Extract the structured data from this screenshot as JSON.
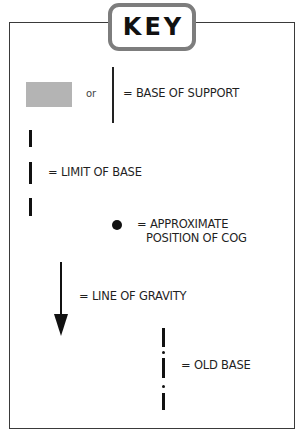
{
  "title": "KEY",
  "colors": {
    "key_border": "#7d7d7d",
    "base_of_support_fill": "#b4b4b4",
    "line": "#111111",
    "frame": "#3a3a3a"
  },
  "entries": [
    {
      "id": "base-of-support",
      "symbols": [
        "gray-rectangle",
        "vertical-line"
      ],
      "separator": "or",
      "label": "= BASE OF SUPPORT"
    },
    {
      "id": "limit-of-base",
      "symbols": [
        "thick-dashed-vertical-line"
      ],
      "label": "= LIMIT OF BASE"
    },
    {
      "id": "cog",
      "symbols": [
        "filled-dot"
      ],
      "label_line1": "= APPROXIMATE",
      "label_line2": "POSITION OF COG"
    },
    {
      "id": "line-of-gravity",
      "symbols": [
        "down-arrow"
      ],
      "label": "= LINE OF GRAVITY"
    },
    {
      "id": "old-base",
      "symbols": [
        "dash-dot-vertical-line"
      ],
      "label": "= OLD BASE"
    }
  ]
}
